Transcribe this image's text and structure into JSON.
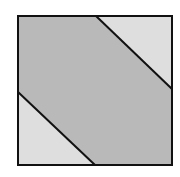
{
  "diagram": {
    "square": {
      "x": 18,
      "y": 16,
      "width": 154,
      "height": 149
    },
    "colors": {
      "background": "#ffffff",
      "band": "#b9b9b9",
      "corner": "#dedede",
      "stroke": "#111111"
    },
    "stroke_width": 2,
    "lines": [
      {
        "name": "upper-diagonal",
        "x1": 96,
        "y1": 16,
        "x2": 172,
        "y2": 89
      },
      {
        "name": "lower-diagonal",
        "x1": 18,
        "y1": 92,
        "x2": 95,
        "y2": 165
      }
    ],
    "regions": [
      {
        "name": "top-right-triangle",
        "shade": "light"
      },
      {
        "name": "central-band",
        "shade": "dark"
      },
      {
        "name": "bottom-left-triangle",
        "shade": "light"
      }
    ]
  }
}
